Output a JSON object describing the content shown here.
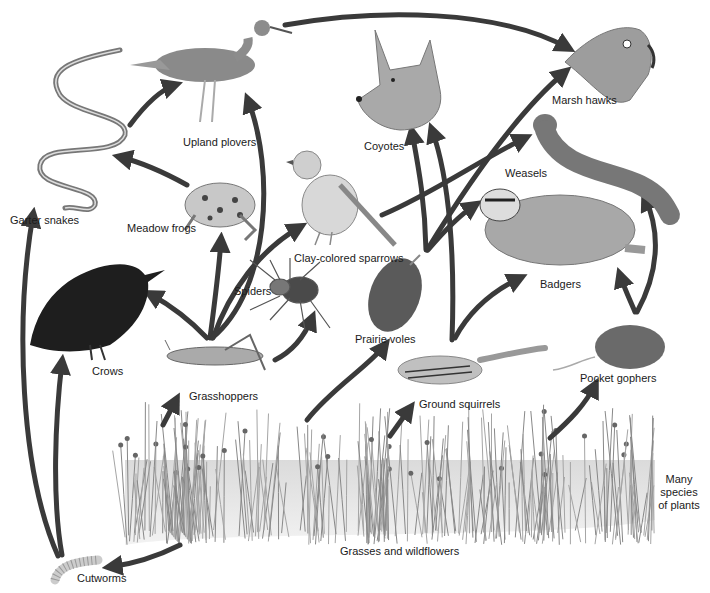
{
  "colors": {
    "arrow": "#3a3a3a",
    "ink": "#1a1a1a",
    "grass": "#9a9a9a"
  },
  "organisms": {
    "garter_snakes": "Garter snakes",
    "upland_plovers": "Upland plovers",
    "meadow_frogs": "Meadow frogs",
    "clay_colored_sparrows": "Clay-colored sparrows",
    "coyotes": "Coyotes",
    "marsh_hawks": "Marsh hawks",
    "weasels": "Weasels",
    "badgers": "Badgers",
    "spiders": "Spiders",
    "crows": "Crows",
    "grasshoppers": "Grasshoppers",
    "prairie_voles": "Prairie voles",
    "ground_squirrels": "Ground squirrels",
    "pocket_gophers": "Pocket gophers",
    "grasses": "Grasses and wildflowers",
    "plants_note_1": "Many",
    "plants_note_2": "species",
    "plants_note_3": "of plants",
    "cutworms": "Cutworms"
  },
  "links": [
    {
      "from": "Grasses and wildflowers",
      "to": "Grasshoppers"
    },
    {
      "from": "Grasses and wildflowers",
      "to": "Prairie voles"
    },
    {
      "from": "Grasses and wildflowers",
      "to": "Ground squirrels"
    },
    {
      "from": "Grasses and wildflowers",
      "to": "Pocket gophers"
    },
    {
      "from": "Grasses and wildflowers",
      "to": "Cutworms"
    },
    {
      "from": "Cutworms",
      "to": "Crows"
    },
    {
      "from": "Cutworms",
      "to": "Garter snakes"
    },
    {
      "from": "Grasshoppers",
      "to": "Crows"
    },
    {
      "from": "Grasshoppers",
      "to": "Meadow frogs"
    },
    {
      "from": "Grasshoppers",
      "to": "Upland plovers"
    },
    {
      "from": "Grasshoppers",
      "to": "Clay-colored sparrows"
    },
    {
      "from": "Grasshoppers",
      "to": "Spiders"
    },
    {
      "from": "Meadow frogs",
      "to": "Garter snakes"
    },
    {
      "from": "Garter snakes",
      "to": "Upland plovers"
    },
    {
      "from": "Upland plovers",
      "to": "Marsh hawks"
    },
    {
      "from": "Clay-colored sparrows",
      "to": "Weasels"
    },
    {
      "from": "Prairie voles",
      "to": "Coyotes"
    },
    {
      "from": "Prairie voles",
      "to": "Marsh hawks"
    },
    {
      "from": "Prairie voles",
      "to": "Weasels"
    },
    {
      "from": "Prairie voles",
      "to": "Badgers"
    },
    {
      "from": "Ground squirrels",
      "to": "Coyotes"
    },
    {
      "from": "Ground squirrels",
      "to": "Badgers"
    },
    {
      "from": "Pocket gophers",
      "to": "Badgers"
    },
    {
      "from": "Pocket gophers",
      "to": "Weasels"
    }
  ]
}
